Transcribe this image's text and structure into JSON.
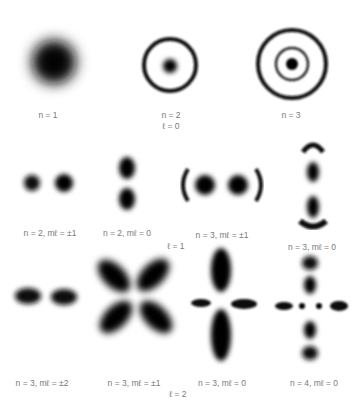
{
  "groups": [
    {
      "label": "ℓ = 0",
      "orbitals": [
        {
          "id": "1s",
          "label": "n = 1"
        },
        {
          "id": "2s",
          "label": "n = 2"
        },
        {
          "id": "3s",
          "label": "n = 3"
        }
      ]
    },
    {
      "label": "ℓ = 1",
      "orbitals": [
        {
          "id": "2p1",
          "label": "n = 2, mℓ = ±1"
        },
        {
          "id": "2p0",
          "label": "n = 2, mℓ = 0"
        },
        {
          "id": "3p1",
          "label": "n = 3, mℓ = ±1"
        },
        {
          "id": "3p0",
          "label": "n = 3, mℓ = 0"
        }
      ]
    },
    {
      "label": "ℓ = 2",
      "orbitals": [
        {
          "id": "3d2",
          "label": "n = 3, mℓ = ±2"
        },
        {
          "id": "3d1",
          "label": "n = 3, mℓ = ±1"
        },
        {
          "id": "3d0",
          "label": "n = 3, mℓ = 0"
        },
        {
          "id": "4d0",
          "label": "n = 4, mℓ = 0"
        }
      ]
    }
  ],
  "colors": {
    "density": "#111111",
    "background": "#ffffff",
    "label": "#7a7a7a"
  }
}
